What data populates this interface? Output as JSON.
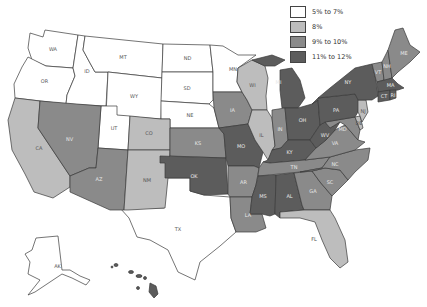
{
  "map": {
    "type": "choropleth",
    "region": "United States",
    "legend": [
      {
        "label": "5% to 7%",
        "color": "#ffffff",
        "key": "c1"
      },
      {
        "label": "8%",
        "color": "#bdbdbd",
        "key": "c2"
      },
      {
        "label": "9% to 10%",
        "color": "#8a8a8a",
        "key": "c3"
      },
      {
        "label": "11% to 12%",
        "color": "#5c5c5c",
        "key": "c4"
      }
    ],
    "states": [
      {
        "abbr": "WA",
        "category": "5% to 7%"
      },
      {
        "abbr": "OR",
        "category": "5% to 7%"
      },
      {
        "abbr": "ID",
        "category": "5% to 7%"
      },
      {
        "abbr": "MT",
        "category": "5% to 7%"
      },
      {
        "abbr": "WY",
        "category": "5% to 7%"
      },
      {
        "abbr": "ND",
        "category": "5% to 7%"
      },
      {
        "abbr": "SD",
        "category": "5% to 7%"
      },
      {
        "abbr": "NE",
        "category": "5% to 7%"
      },
      {
        "abbr": "MN",
        "category": "5% to 7%"
      },
      {
        "abbr": "UT",
        "category": "5% to 7%"
      },
      {
        "abbr": "TX",
        "category": "5% to 7%"
      },
      {
        "abbr": "AK",
        "category": "5% to 7%"
      },
      {
        "abbr": "CA",
        "category": "8%"
      },
      {
        "abbr": "CO",
        "category": "8%"
      },
      {
        "abbr": "NM",
        "category": "8%"
      },
      {
        "abbr": "WI",
        "category": "8%"
      },
      {
        "abbr": "IL",
        "category": "8%"
      },
      {
        "abbr": "FL",
        "category": "8%"
      },
      {
        "abbr": "NJ",
        "category": "8%"
      },
      {
        "abbr": "DE",
        "category": "8%"
      },
      {
        "abbr": "NV",
        "category": "9% to 10%"
      },
      {
        "abbr": "AZ",
        "category": "9% to 10%"
      },
      {
        "abbr": "KS",
        "category": "9% to 10%"
      },
      {
        "abbr": "IA",
        "category": "9% to 10%"
      },
      {
        "abbr": "AR",
        "category": "9% to 10%"
      },
      {
        "abbr": "LA",
        "category": "9% to 10%"
      },
      {
        "abbr": "IN",
        "category": "9% to 10%"
      },
      {
        "abbr": "TN",
        "category": "9% to 10%"
      },
      {
        "abbr": "GA",
        "category": "9% to 10%"
      },
      {
        "abbr": "SC",
        "category": "9% to 10%"
      },
      {
        "abbr": "NC",
        "category": "9% to 10%"
      },
      {
        "abbr": "VA",
        "category": "9% to 10%"
      },
      {
        "abbr": "MD",
        "category": "9% to 10%"
      },
      {
        "abbr": "ME",
        "category": "9% to 10%"
      },
      {
        "abbr": "NH",
        "category": "9% to 10%"
      },
      {
        "abbr": "VT",
        "category": "9% to 10%"
      },
      {
        "abbr": "OK",
        "category": "11% to 12%"
      },
      {
        "abbr": "MO",
        "category": "11% to 12%"
      },
      {
        "abbr": "MS",
        "category": "11% to 12%"
      },
      {
        "abbr": "AL",
        "category": "11% to 12%"
      },
      {
        "abbr": "KY",
        "category": "11% to 12%"
      },
      {
        "abbr": "WV",
        "category": "11% to 12%"
      },
      {
        "abbr": "OH",
        "category": "11% to 12%"
      },
      {
        "abbr": "MI",
        "category": "11% to 12%"
      },
      {
        "abbr": "PA",
        "category": "11% to 12%"
      },
      {
        "abbr": "NY",
        "category": "11% to 12%"
      },
      {
        "abbr": "MA",
        "category": "11% to 12%"
      },
      {
        "abbr": "CT",
        "category": "11% to 12%"
      },
      {
        "abbr": "RI",
        "category": "11% to 12%"
      },
      {
        "abbr": "HI",
        "category": "11% to 12%"
      }
    ]
  }
}
